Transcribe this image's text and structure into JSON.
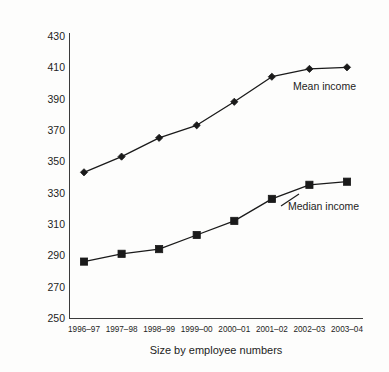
{
  "chart_data": {
    "type": "line",
    "title": "",
    "subtitle": "",
    "xlabel": "Size by employee numbers",
    "ylabel": "£ per week, 2003–04 prices",
    "categories": [
      "1996–97",
      "1997–98",
      "1998–99",
      "1999–00",
      "2000–01",
      "2001–02",
      "2002–03",
      "2003–04"
    ],
    "series": [
      {
        "name": "Mean income",
        "marker": "diamond",
        "color": "#1a1a1a",
        "values": [
          343,
          353,
          365,
          373,
          388,
          404,
          409,
          410
        ]
      },
      {
        "name": "Median income",
        "marker": "square",
        "color": "#1a1a1a",
        "values": [
          286,
          291,
          294,
          303,
          312,
          326,
          335,
          337
        ]
      }
    ],
    "ylim": [
      250,
      430
    ],
    "yticks": [
      250,
      270,
      290,
      310,
      330,
      350,
      370,
      390,
      410,
      430
    ],
    "ytick_labels": [
      "250",
      "270",
      "290",
      "310",
      "330",
      "350",
      "370",
      "390",
      "410",
      "430"
    ],
    "grid": false,
    "legend": "inline-annotations",
    "annotations": [
      {
        "text": "Mean income",
        "series": "Mean income"
      },
      {
        "text": "Median income",
        "series": "Median income"
      }
    ]
  }
}
